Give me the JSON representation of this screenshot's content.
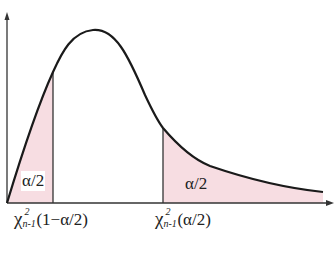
{
  "diagram": {
    "type": "chi-square distribution with two-tailed rejection regions",
    "colors": {
      "curve": "#1a1a1a",
      "axis": "#333333",
      "tail_fill": "#f7dde2"
    },
    "tail_labels": {
      "left": "α/2",
      "right": "α/2"
    },
    "x_labels": {
      "left": {
        "symbol": "χ",
        "superscript": "2",
        "subscript": "n-1",
        "argument": "(1−α/2)"
      },
      "right": {
        "symbol": "χ",
        "superscript": "2",
        "subscript": "n-1",
        "argument": "(α/2)"
      }
    }
  }
}
